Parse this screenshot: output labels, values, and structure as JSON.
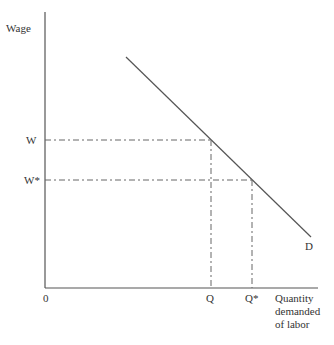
{
  "diagram": {
    "type": "labor-demand-curve",
    "y_axis_label": "Wage",
    "x_axis_label_lines": [
      "Quantity",
      "demanded",
      "of labor"
    ],
    "origin_label": "0",
    "curve_label": "D",
    "wage_levels": [
      {
        "label": "W",
        "y": 140,
        "quantity_label": "Q",
        "x": 211
      },
      {
        "label": "W*",
        "y": 180,
        "quantity_label": "Q*",
        "x": 252
      }
    ],
    "demand_line": {
      "x1": 126,
      "y1": 57,
      "x2": 311,
      "y2": 237
    },
    "axes": {
      "origin_x": 45,
      "origin_y": 288,
      "y_top": 12,
      "x_right": 318
    },
    "colors": {
      "line": "#555555",
      "text": "#333333"
    }
  }
}
